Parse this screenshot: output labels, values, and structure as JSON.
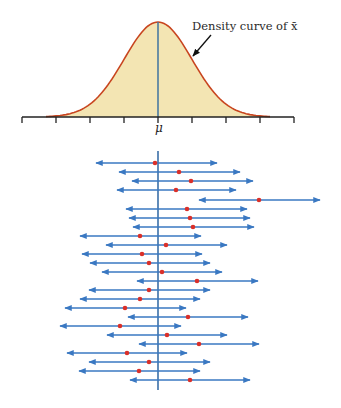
{
  "figure": {
    "annotation": "Density curve of x̄",
    "axis_label_center": "μ",
    "colors": {
      "curve_stroke": "#c8451f",
      "curve_fill": "#f3e5b3",
      "mean_line": "#4a7aa0",
      "interval_line": "#3a78c2",
      "sample_mean_dot": "#d9302a",
      "axis": "#222222",
      "arrow": "#111111"
    }
  },
  "chart_data": {
    "type": "line",
    "title": "",
    "density_curve": {
      "label": "Density curve of x̄",
      "center": "μ",
      "axis_ticks_px": [
        22,
        56,
        90,
        124,
        158,
        192,
        226,
        260,
        294
      ],
      "sd_units_per_tick": 1,
      "tick_labels": [
        "",
        "",
        "",
        "",
        "μ",
        "",
        "",
        "",
        ""
      ]
    },
    "intervals_in_sd_units_from_mu": {
      "note": "Positions in axis-tick units relative to μ (1 tick ≈ 34px); each interval has half-width ≈ 1.78 units",
      "rows": [
        {
          "left": -1.82,
          "center": -0.09,
          "right": 1.74,
          "covers_mu": true
        },
        {
          "left": -1.15,
          "center": 0.62,
          "right": 2.41,
          "covers_mu": true
        },
        {
          "left": -0.76,
          "center": 0.97,
          "right": 2.79,
          "covers_mu": true
        },
        {
          "left": -1.21,
          "center": 0.53,
          "right": 2.29,
          "covers_mu": true
        },
        {
          "left": 1.21,
          "center": 2.97,
          "right": 4.76,
          "covers_mu": false
        },
        {
          "left": -0.94,
          "center": 0.85,
          "right": 2.62,
          "covers_mu": true
        },
        {
          "left": -0.85,
          "center": 0.94,
          "right": 2.71,
          "covers_mu": true
        },
        {
          "left": -0.74,
          "center": 1.03,
          "right": 2.82,
          "covers_mu": true
        },
        {
          "left": -2.29,
          "center": -0.53,
          "right": 1.26,
          "covers_mu": true
        },
        {
          "left": -1.53,
          "center": 0.24,
          "right": 2.03,
          "covers_mu": true
        },
        {
          "left": -2.24,
          "center": -0.47,
          "right": 1.29,
          "covers_mu": true
        },
        {
          "left": -2.0,
          "center": -0.26,
          "right": 1.53,
          "covers_mu": true
        },
        {
          "left": -1.65,
          "center": 0.12,
          "right": 1.88,
          "covers_mu": true
        },
        {
          "left": -0.62,
          "center": 1.15,
          "right": 2.94,
          "covers_mu": true
        },
        {
          "left": -2.03,
          "center": -0.26,
          "right": 1.53,
          "covers_mu": true
        },
        {
          "left": -2.29,
          "center": -0.53,
          "right": 1.24,
          "covers_mu": true
        },
        {
          "left": -2.74,
          "center": -0.97,
          "right": 0.82,
          "covers_mu": true
        },
        {
          "left": -0.88,
          "center": 0.88,
          "right": 2.65,
          "covers_mu": true
        },
        {
          "left": -2.88,
          "center": -1.12,
          "right": 0.68,
          "covers_mu": true
        },
        {
          "left": -1.5,
          "center": 0.26,
          "right": 2.03,
          "covers_mu": true
        },
        {
          "left": -0.56,
          "center": 1.21,
          "right": 2.97,
          "covers_mu": true
        },
        {
          "left": -2.68,
          "center": -0.91,
          "right": 0.85,
          "covers_mu": true
        },
        {
          "left": -2.03,
          "center": -0.26,
          "right": 1.53,
          "covers_mu": true
        },
        {
          "left": -2.32,
          "center": -0.56,
          "right": 1.24,
          "covers_mu": true
        },
        {
          "left": -0.82,
          "center": 0.94,
          "right": 2.71,
          "covers_mu": true
        }
      ]
    },
    "intervals_px": [
      {
        "y": 163,
        "left": 96,
        "dot": 155,
        "right": 217
      },
      {
        "y": 172,
        "left": 119,
        "dot": 179,
        "right": 240
      },
      {
        "y": 181,
        "left": 132,
        "dot": 191,
        "right": 253
      },
      {
        "y": 190,
        "left": 117,
        "dot": 176,
        "right": 236
      },
      {
        "y": 200,
        "left": 199,
        "dot": 259,
        "right": 320
      },
      {
        "y": 209,
        "left": 126,
        "dot": 187,
        "right": 247
      },
      {
        "y": 218,
        "left": 129,
        "dot": 190,
        "right": 250
      },
      {
        "y": 227,
        "left": 133,
        "dot": 193,
        "right": 254
      },
      {
        "y": 236,
        "left": 80,
        "dot": 140,
        "right": 201
      },
      {
        "y": 245,
        "left": 106,
        "dot": 166,
        "right": 227
      },
      {
        "y": 254,
        "left": 82,
        "dot": 142,
        "right": 202
      },
      {
        "y": 263,
        "left": 90,
        "dot": 149,
        "right": 210
      },
      {
        "y": 272,
        "left": 102,
        "dot": 162,
        "right": 222
      },
      {
        "y": 281,
        "left": 137,
        "dot": 197,
        "right": 258
      },
      {
        "y": 290,
        "left": 89,
        "dot": 149,
        "right": 210
      },
      {
        "y": 299,
        "left": 80,
        "dot": 140,
        "right": 200
      },
      {
        "y": 308,
        "left": 65,
        "dot": 125,
        "right": 186
      },
      {
        "y": 317,
        "left": 128,
        "dot": 188,
        "right": 248
      },
      {
        "y": 326,
        "left": 60,
        "dot": 120,
        "right": 181
      },
      {
        "y": 335,
        "left": 107,
        "dot": 167,
        "right": 227
      },
      {
        "y": 344,
        "left": 139,
        "dot": 199,
        "right": 259
      },
      {
        "y": 353,
        "left": 67,
        "dot": 127,
        "right": 187
      },
      {
        "y": 362,
        "left": 89,
        "dot": 149,
        "right": 210
      },
      {
        "y": 371,
        "left": 79,
        "dot": 139,
        "right": 200
      },
      {
        "y": 380,
        "left": 130,
        "dot": 190,
        "right": 250
      }
    ],
    "intervals_covering_mu": 24,
    "intervals_total": 25,
    "xlabel": "μ",
    "ylabel": "",
    "grid": false,
    "legend": null
  }
}
